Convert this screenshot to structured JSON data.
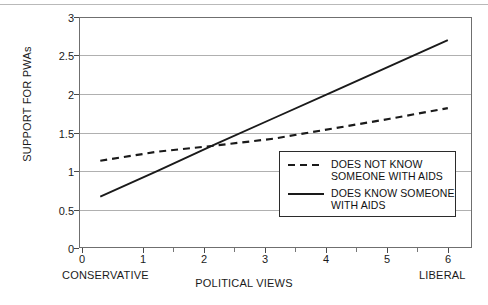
{
  "chart_data": {
    "type": "line",
    "title": "",
    "xlabel": "POLITICAL VIEWS",
    "ylabel": "SUPPORT FOR PWAs",
    "xlim": [
      -0.35,
      6.4
    ],
    "ylim": [
      0,
      3
    ],
    "grid": true,
    "legend_position": "center-right-inside",
    "x": [
      0,
      1,
      2,
      3,
      4,
      5,
      6
    ],
    "xticks": [
      "0",
      "1",
      "2",
      "3",
      "4",
      "5",
      "6"
    ],
    "yticks": [
      "0",
      "0.5",
      "1",
      "1.5",
      "2",
      "2.5",
      "3"
    ],
    "x_axis_endpoint_labels": {
      "left": "CONSERVATIVE",
      "right": "LIBERAL"
    },
    "series": [
      {
        "name": "DOES NOT KNOW\nSOMEONE WITH AIDS",
        "style": "dashed",
        "color": "#1a1a1a",
        "values": [
          1.13,
          1.25,
          1.33,
          1.42,
          1.55,
          1.68,
          1.82
        ]
      },
      {
        "name": "DOES KNOW SOMEONE\nWITH AIDS",
        "style": "solid",
        "color": "#1a1a1a",
        "values": [
          0.66,
          1.0,
          1.35,
          1.69,
          2.03,
          2.37,
          2.71
        ]
      }
    ],
    "annotations": [
      {
        "text": "lines cross near x=1.9, y=1.32"
      }
    ]
  },
  "legend": {
    "items": [
      {
        "label": "DOES NOT KNOW\nSOMEONE WITH AIDS",
        "style": "dashed"
      },
      {
        "label": "DOES KNOW SOMEONE\nWITH AIDS",
        "style": "solid"
      }
    ]
  },
  "colors": {
    "axis": "#6f6f6f",
    "grid": "#b0b0b0",
    "line": "#1a1a1a",
    "text": "#1a1a1a",
    "background": "#ffffff"
  }
}
